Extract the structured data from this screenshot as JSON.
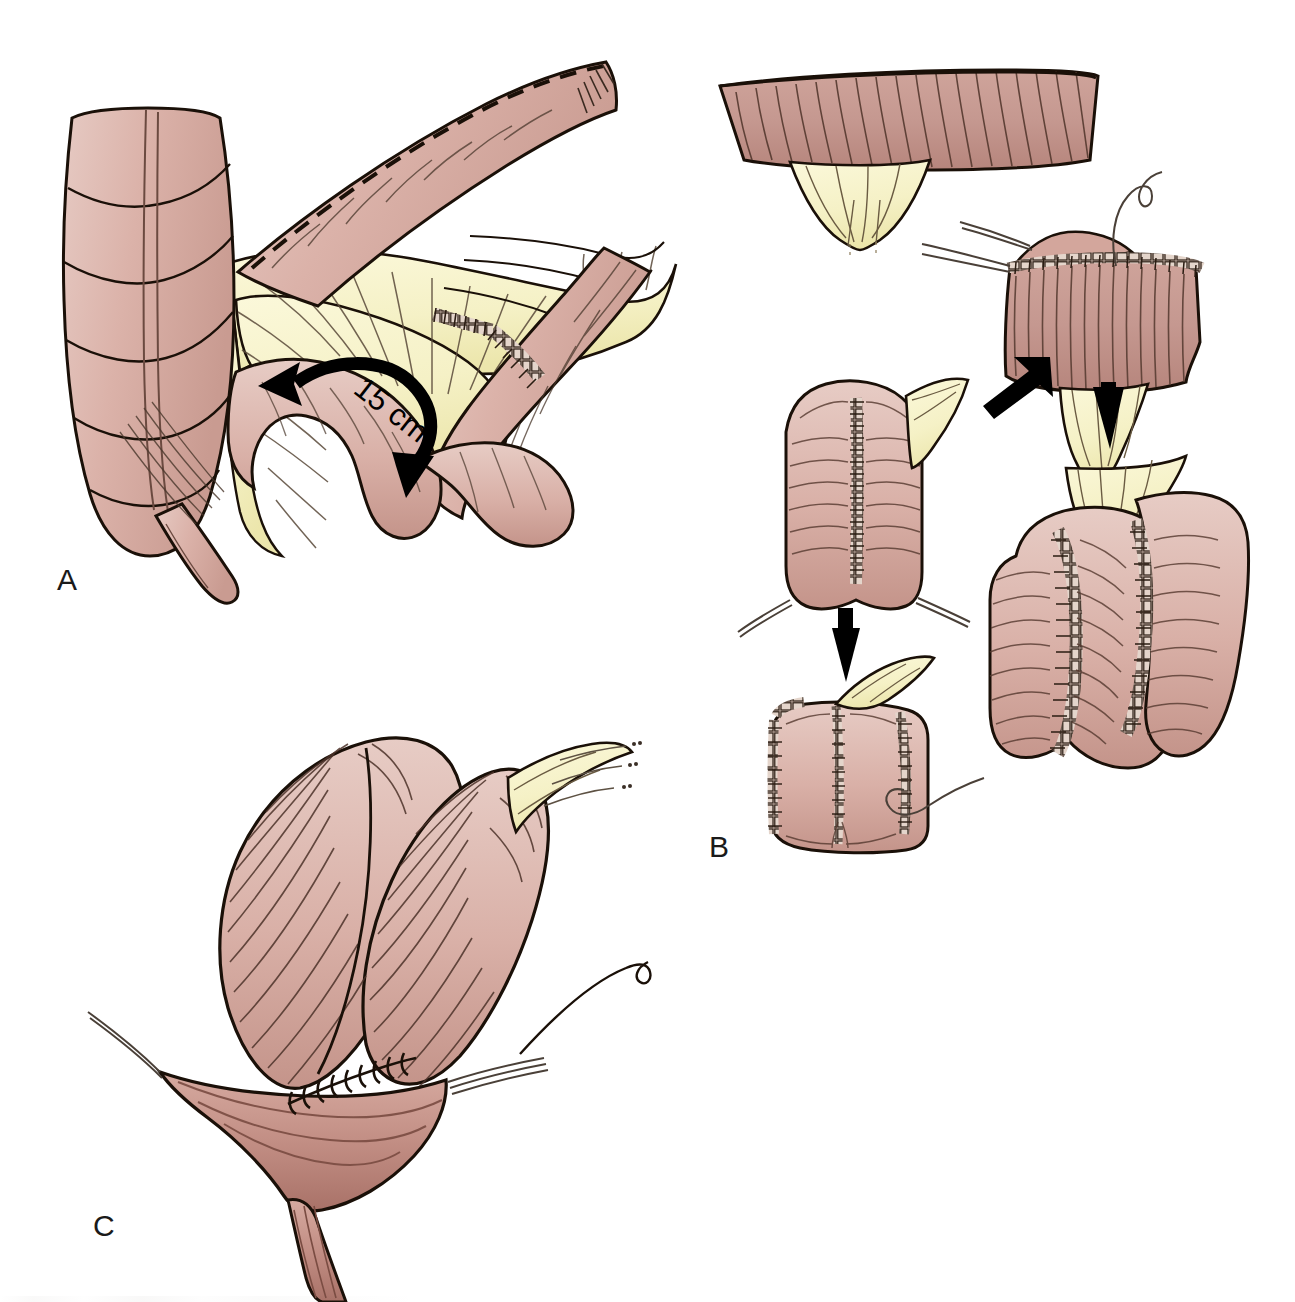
{
  "figure": {
    "type": "surgical-illustration",
    "background_color": "#ffffff",
    "width": 1295,
    "height": 1302
  },
  "palette": {
    "bowel_serosa": "#d9b0a7",
    "bowel_serosa_light": "#e3c2ba",
    "bowel_serosa_shadow": "#c79a90",
    "mucosa": "#c79b93",
    "mucosa_dark": "#a8786f",
    "cut_edge_dark": "#9c6f66",
    "mesentery": "#f6f3cd",
    "mesentery_shadow": "#ece7b4",
    "ink": "#1a1008",
    "ink_soft": "#4a382c",
    "suture_thread": "#6b5f58",
    "arrow_black": "#000000",
    "staple_fill": "#d6c3b8"
  },
  "panels": [
    {
      "id": "A",
      "label": "A",
      "name": "panel-a-terminal-ileum-and-mesentery",
      "description": "Terminal ileum and cecum with mesentery; dashed antimesenteric incision line; 15 cm limb measurement with curved double-headed arrow; stapled anastomosis line",
      "annotations": [
        {
          "name": "measurement-15cm",
          "text": "15 cm",
          "value": 15,
          "unit": "cm",
          "rotation_deg": 38
        },
        {
          "name": "dashed-incision-line",
          "style": "dashed"
        },
        {
          "name": "staple-line",
          "style": "staples"
        }
      ]
    },
    {
      "id": "B",
      "label": "B",
      "name": "panel-b-pouch-suturing-sequence",
      "description": "Four-step sequence: opened bowel limb, running suture of posterior wall, folded pouch, completed J-pouch",
      "steps": [
        {
          "name": "step-opened-limb",
          "order": 1
        },
        {
          "name": "step-running-suture",
          "order": 2
        },
        {
          "name": "step-folded-pouch",
          "order": 3
        },
        {
          "name": "step-completed-pouch",
          "order": 4
        }
      ],
      "arrows": [
        {
          "name": "arrow-down-left",
          "direction": "down-left"
        },
        {
          "name": "arrow-down-right-column",
          "direction": "down"
        },
        {
          "name": "arrow-down-left-column",
          "direction": "down"
        }
      ]
    },
    {
      "id": "C",
      "label": "C",
      "name": "panel-c-ileoanal-anastomosis",
      "description": "Completed J-pouch sutured to the anal canal with interrupted sutures and stay sutures",
      "annotations": [
        {
          "name": "interrupted-suture-line",
          "style": "interrupted"
        },
        {
          "name": "stay-sutures",
          "style": "threads"
        }
      ]
    }
  ]
}
